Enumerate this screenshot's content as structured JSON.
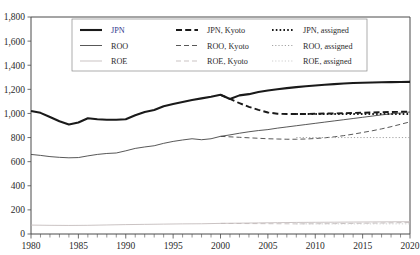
{
  "chart_data": {
    "type": "line",
    "title": "",
    "xlabel": "",
    "ylabel": "",
    "xlim": [
      1980,
      2020
    ],
    "ylim": [
      0,
      1800
    ],
    "ytick_labels": [
      "0",
      "200",
      "400",
      "600",
      "800",
      "1,000",
      "1,200",
      "1,400",
      "1,600",
      "1,800"
    ],
    "ytick_values": [
      0,
      200,
      400,
      600,
      800,
      1000,
      1200,
      1400,
      1600,
      1800
    ],
    "xtick_labels": [
      "1980",
      "1985",
      "1990",
      "1995",
      "2000",
      "2005",
      "2010",
      "2015",
      "2020"
    ],
    "xtick_values": [
      1980,
      1985,
      1990,
      1995,
      2000,
      2005,
      2010,
      2015,
      2020
    ],
    "xtick_minor_step": 1,
    "grid": false,
    "legend_position": "upper-center-inside",
    "legend_entries": [
      {
        "label": "JPN",
        "style": "solid",
        "weight": "thick",
        "color": "#1a1a1a",
        "label_color": "#2d3a8c"
      },
      {
        "label": "JPN, Kyoto",
        "style": "dashed",
        "weight": "thick",
        "color": "#1a1a1a",
        "label_color": "#2b2b2b"
      },
      {
        "label": "JPN, assigned",
        "style": "dotted",
        "weight": "thick",
        "color": "#1a1a1a",
        "label_color": "#2b2b2b"
      },
      {
        "label": "ROO",
        "style": "solid",
        "weight": "thin",
        "color": "#3a3a3a",
        "label_color": "#2b2b2b"
      },
      {
        "label": "ROO, Kyoto",
        "style": "dashed",
        "weight": "thin",
        "color": "#3a3a3a",
        "label_color": "#2b2b2b"
      },
      {
        "label": "ROO, assigned",
        "style": "dotted",
        "weight": "thin",
        "color": "#9a9a9a",
        "label_color": "#2b2b2b"
      },
      {
        "label": "ROE",
        "style": "solid",
        "weight": "thin",
        "color": "#c0b8b8",
        "label_color": "#2b2b2b"
      },
      {
        "label": "ROE, Kyoto",
        "style": "dashed",
        "weight": "thin",
        "color": "#c0b8b8",
        "label_color": "#2b2b2b"
      },
      {
        "label": "ROE, assigned",
        "style": "dotted",
        "weight": "thin",
        "color": "#c8c8c8",
        "label_color": "#2b2b2b"
      }
    ],
    "series": [
      {
        "name": "JPN",
        "style": "solid",
        "weight": "thick",
        "color": "#1a1a1a",
        "x": [
          1980,
          1981,
          1982,
          1983,
          1984,
          1985,
          1986,
          1987,
          1988,
          1989,
          1990,
          1991,
          1992,
          1993,
          1994,
          1995,
          1996,
          1997,
          1998,
          1999,
          2000,
          2001,
          2002,
          2003,
          2004,
          2005,
          2006,
          2007,
          2008,
          2009,
          2010,
          2011,
          2012,
          2013,
          2014,
          2015,
          2016,
          2017,
          2018,
          2019,
          2020
        ],
        "values": [
          1020,
          1005,
          970,
          935,
          908,
          925,
          960,
          952,
          948,
          948,
          952,
          985,
          1012,
          1028,
          1060,
          1078,
          1095,
          1112,
          1125,
          1138,
          1155,
          1120,
          1150,
          1160,
          1178,
          1190,
          1200,
          1210,
          1218,
          1226,
          1232,
          1238,
          1243,
          1248,
          1252,
          1255,
          1257,
          1259,
          1260,
          1261,
          1262
        ]
      },
      {
        "name": "JPN, Kyoto",
        "style": "dashed",
        "weight": "thick",
        "color": "#1a1a1a",
        "x": [
          2000,
          2001,
          2002,
          2003,
          2004,
          2005,
          2006,
          2007,
          2008,
          2009,
          2010,
          2011,
          2012,
          2013,
          2014,
          2015,
          2016,
          2017,
          2018,
          2019,
          2020
        ],
        "values": [
          1155,
          1120,
          1085,
          1055,
          1030,
          1008,
          998,
          995,
          995,
          996,
          997,
          999,
          1000,
          1002,
          1004,
          1006,
          1008,
          1010,
          1012,
          1014,
          1016
        ]
      },
      {
        "name": "JPN, assigned",
        "style": "dotted",
        "weight": "thick",
        "color": "#1a1a1a",
        "x": [
          2008,
          2009,
          2010,
          2011,
          2012,
          2013,
          2014,
          2015,
          2016,
          2017,
          2018,
          2019,
          2020
        ],
        "values": [
          995,
          995,
          995,
          995,
          995,
          995,
          995,
          995,
          995,
          995,
          995,
          995,
          995
        ]
      },
      {
        "name": "ROO",
        "style": "solid",
        "weight": "thin",
        "color": "#3a3a3a",
        "x": [
          1980,
          1981,
          1982,
          1983,
          1984,
          1985,
          1986,
          1987,
          1988,
          1989,
          1990,
          1991,
          1992,
          1993,
          1994,
          1995,
          1996,
          1997,
          1998,
          1999,
          2000,
          2001,
          2002,
          2003,
          2004,
          2005,
          2006,
          2007,
          2008,
          2009,
          2010,
          2011,
          2012,
          2013,
          2014,
          2015,
          2016,
          2017,
          2018,
          2019,
          2020
        ],
        "values": [
          660,
          652,
          642,
          636,
          632,
          634,
          648,
          660,
          668,
          672,
          690,
          710,
          722,
          732,
          752,
          768,
          780,
          790,
          782,
          790,
          810,
          822,
          836,
          848,
          858,
          866,
          878,
          888,
          898,
          908,
          918,
          928,
          938,
          948,
          958,
          968,
          978,
          988,
          996,
          1004,
          1012
        ]
      },
      {
        "name": "ROO, Kyoto",
        "style": "dashed",
        "weight": "thin",
        "color": "#3a3a3a",
        "x": [
          2000,
          2001,
          2002,
          2003,
          2004,
          2005,
          2006,
          2007,
          2008,
          2009,
          2010,
          2011,
          2012,
          2013,
          2014,
          2015,
          2016,
          2017,
          2018,
          2019,
          2020
        ],
        "values": [
          810,
          806,
          802,
          798,
          794,
          790,
          788,
          786,
          786,
          788,
          792,
          798,
          806,
          816,
          828,
          842,
          856,
          872,
          890,
          910,
          930
        ]
      },
      {
        "name": "ROO, assigned",
        "style": "dotted",
        "weight": "thin",
        "color": "#9a9a9a",
        "x": [
          2008,
          2009,
          2010,
          2011,
          2012,
          2013,
          2014,
          2015,
          2016,
          2017,
          2018,
          2019,
          2020
        ],
        "values": [
          800,
          800,
          800,
          800,
          800,
          800,
          800,
          800,
          800,
          800,
          800,
          800,
          800
        ]
      },
      {
        "name": "ROE",
        "style": "solid",
        "weight": "thin",
        "color": "#c0b8b8",
        "x": [
          1980,
          1982,
          1984,
          1986,
          1988,
          1990,
          1992,
          1994,
          1996,
          1998,
          2000,
          2002,
          2004,
          2006,
          2008,
          2010,
          2012,
          2014,
          2016,
          2018,
          2020
        ],
        "values": [
          74,
          72,
          71,
          72,
          75,
          78,
          80,
          82,
          84,
          85,
          88,
          90,
          92,
          94,
          96,
          97,
          98,
          99,
          100,
          101,
          102
        ]
      },
      {
        "name": "ROE, Kyoto",
        "style": "dashed",
        "weight": "thin",
        "color": "#c0b8b8",
        "x": [
          2000,
          2004,
          2008,
          2012,
          2016,
          2020
        ],
        "values": [
          88,
          86,
          84,
          86,
          90,
          95
        ]
      },
      {
        "name": "ROE, assigned",
        "style": "dotted",
        "weight": "thin",
        "color": "#c8c8c8",
        "x": [
          2008,
          2012,
          2016,
          2020
        ],
        "values": [
          84,
          84,
          84,
          84
        ]
      }
    ]
  }
}
